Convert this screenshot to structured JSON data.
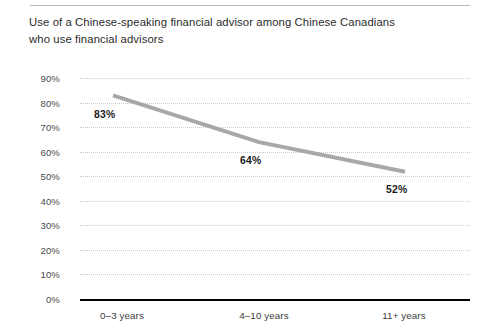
{
  "chart_data": {
    "type": "line",
    "title": "Use of a Chinese-speaking financial advisor among Chinese Canadians who use financial advisors",
    "title_line1": "Use of a Chinese-speaking financial advisor among Chinese Canadians",
    "title_line2": "who use financial advisors",
    "xlabel": "",
    "ylabel": "",
    "categories": [
      "0–3 years",
      "4–10 years",
      "11+ years"
    ],
    "values": [
      83,
      64,
      52
    ],
    "data_labels": [
      "83%",
      "64%",
      "52%"
    ],
    "ylim": [
      0,
      90
    ],
    "ytick_values": [
      0,
      10,
      20,
      30,
      40,
      50,
      60,
      70,
      80,
      90
    ],
    "ytick_labels": [
      "0%",
      "10%",
      "20%",
      "30%",
      "40%",
      "50%",
      "60%",
      "70%",
      "80%",
      "90%"
    ],
    "grid": true,
    "grid_style": "dotted-horizontal",
    "legend": false,
    "series": [
      {
        "name": "Use of a Chinese-speaking financial advisor",
        "values": [
          83,
          64,
          52
        ],
        "color": "#a8a8a8"
      }
    ],
    "colors": {
      "line": "#a8a8a8",
      "gridline": "#cccccc",
      "baseline": "#000000",
      "top_rule": "#b9b9b9",
      "title_text": "#2b2b2b",
      "tick_text": "#4a4a4a",
      "value_text": "#1a1a1a"
    }
  }
}
